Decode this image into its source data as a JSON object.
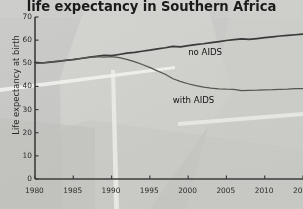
{
  "chart_data": {
    "type": "line",
    "title": "life expectancy in Southern Africa",
    "xlabel": "",
    "ylabel": "Life expectancy at birth",
    "xlim": [
      1980,
      2015
    ],
    "ylim": [
      0,
      70
    ],
    "grid": false,
    "legend_position": "inline-annotations",
    "xticks": [
      1980,
      1985,
      1990,
      1995,
      2000,
      2005,
      2010,
      2015
    ],
    "xtick_labels": [
      "1980",
      "1985",
      "1990",
      "1995",
      "2000",
      "2005",
      "2010",
      "20"
    ],
    "yticks": [
      0,
      10,
      20,
      30,
      40,
      50,
      60,
      70
    ],
    "ytick_labels": [
      "0",
      "10",
      "20",
      "30",
      "40",
      "50",
      "60",
      "70"
    ],
    "x": [
      1980,
      1981,
      1982,
      1983,
      1984,
      1985,
      1986,
      1987,
      1988,
      1989,
      1990,
      1991,
      1992,
      1993,
      1994,
      1995,
      1996,
      1997,
      1998,
      1999,
      2000,
      2001,
      2002,
      2003,
      2004,
      2005,
      2006,
      2007,
      2008,
      2009,
      2010,
      2011,
      2012,
      2013,
      2014,
      2015
    ],
    "series": [
      {
        "name": "no AIDS",
        "color": "#3a3a3a",
        "values": [
          50.1,
          50.4,
          50.7,
          51.0,
          51.3,
          51.6,
          52.0,
          52.4,
          52.8,
          53.2,
          53.6,
          54.0,
          54.5,
          54.8,
          55.2,
          55.6,
          56.1,
          56.5,
          57.0,
          57.4,
          57.8,
          58.2,
          58.5,
          58.9,
          59.3,
          59.7,
          60.0,
          60.3,
          60.6,
          60.9,
          61.2,
          61.5,
          61.8,
          62.0,
          62.2,
          62.4
        ]
      },
      {
        "name": "with AIDS",
        "color": "#555553",
        "values": [
          50.1,
          50.4,
          50.7,
          51.0,
          51.3,
          51.6,
          52.0,
          52.3,
          52.6,
          52.9,
          53.1,
          52.6,
          51.8,
          50.7,
          49.4,
          48.0,
          46.5,
          45.0,
          43.6,
          42.4,
          41.3,
          40.4,
          39.7,
          39.2,
          38.8,
          38.6,
          38.5,
          38.5,
          38.5,
          38.5,
          38.6,
          38.6,
          38.7,
          38.7,
          38.8,
          38.8
        ]
      }
    ],
    "annotations": [
      {
        "text": "no AIDS",
        "x": 2000,
        "y": 54.5
      },
      {
        "text": "with AIDS",
        "x": 1998,
        "y": 33.5
      }
    ]
  },
  "style": {
    "background": "#c9c9c7",
    "axis_color": "#3d3d3d",
    "title_color": "#1b1b1b",
    "tick_color": "#2c2c2c",
    "watermark_light": "#d2d2cf",
    "watermark_streak": "#f0efe9"
  },
  "icons": {
    "axis": "axis-line-icon"
  }
}
